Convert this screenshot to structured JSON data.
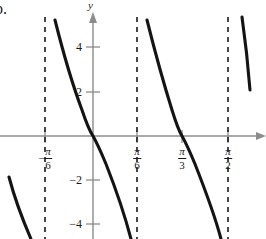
{
  "figure": {
    "part_letter": "b.",
    "background_color": "#ffffff",
    "curve_color": "#141414",
    "axis_color": "#8c8c8c",
    "asymptote_color": "#1a1a1a",
    "width": 266,
    "height": 239
  },
  "axes": {
    "y_axis_name": "y",
    "origin_px": {
      "x": 93,
      "y": 136
    },
    "x_unit_px_per_pi_over_6": 45.5,
    "y_unit_px_per_unit": 22.2
  },
  "y_ticks": [
    {
      "value": 4,
      "label": "4",
      "py": 47
    },
    {
      "value": 2,
      "label": "2",
      "py": 92
    },
    {
      "value": -2,
      "label": "−2",
      "py": 180
    },
    {
      "value": -4,
      "label": "−4",
      "py": 224
    }
  ],
  "x_ticks": [
    {
      "value": "-pi/6",
      "sign": "−",
      "numerator": "π",
      "denominator": "6",
      "px": 45
    },
    {
      "value": "pi/6",
      "sign": "",
      "numerator": "π",
      "denominator": "6",
      "px": 137
    },
    {
      "value": "pi/3",
      "sign": "",
      "numerator": "π",
      "denominator": "3",
      "px": 182
    },
    {
      "value": "pi/2",
      "sign": "",
      "numerator": "π",
      "denominator": "2",
      "px": 228
    }
  ],
  "chart_data": {
    "type": "line",
    "title": "",
    "xlabel": "",
    "ylabel": "y",
    "function": "y = cot(3x)",
    "grid": false,
    "legend": null,
    "xlim_px": [
      0,
      266
    ],
    "ylim": [
      -5.5,
      4.8
    ],
    "x_tick_values": [
      "-π/6",
      "π/6",
      "π/3",
      "π/2"
    ],
    "y_tick_values": [
      4,
      2,
      -2,
      -4
    ],
    "asymptotes": [
      {
        "label": "-π/6",
        "px": 45
      },
      {
        "label": "π/6",
        "px": 137
      },
      {
        "label": "π/2",
        "px": 228
      }
    ],
    "zeros": [
      {
        "label": "0",
        "px": 93
      },
      {
        "label": "π/3",
        "px": 182
      }
    ],
    "branches": [
      {
        "name": "partial-left-bottom",
        "path": "M 9,177 C 14,196 21,216 31,239"
      },
      {
        "name": "branch-neg-pi6-to-pi6",
        "path": "M 55,20 C 61,44 70,78 82,110 C 86,122 89,130 93,136 C 97,143 101,152 106,164 C 117,192 125,216 131,239"
      },
      {
        "name": "branch-pi6-to-pi2",
        "path": "M 147,20 C 153,44 162,78 172,110 C 176,123 179,131 182,136 C 186,143 190,152 195,164 C 206,192 215,216 221,239"
      },
      {
        "name": "partial-right-top",
        "path": "M 242,17 C 245,38 248,64 250,90"
      }
    ]
  }
}
